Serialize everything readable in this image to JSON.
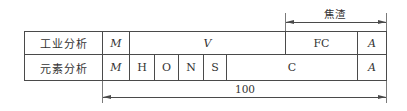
{
  "diagram": {
    "rows": [
      {
        "label": "工业分析",
        "cells": [
          {
            "text": "M",
            "italic": true
          },
          {
            "text": "V",
            "italic": true
          },
          {
            "text": "FC",
            "italic": false
          },
          {
            "text": "A",
            "italic": true
          }
        ]
      },
      {
        "label": "元素分析",
        "cells": [
          {
            "text": "M",
            "italic": true
          },
          {
            "text": "H",
            "italic": false
          },
          {
            "text": "O",
            "italic": false
          },
          {
            "text": "N",
            "italic": false
          },
          {
            "text": "S",
            "italic": false
          },
          {
            "text": "C",
            "italic": false
          },
          {
            "text": "A",
            "italic": true
          }
        ]
      }
    ],
    "top_dimension": {
      "label": "焦渣",
      "spans": [
        "FC",
        "A"
      ]
    },
    "bottom_dimension": {
      "label": "100",
      "spans": [
        "V",
        "FC",
        "A"
      ]
    }
  }
}
